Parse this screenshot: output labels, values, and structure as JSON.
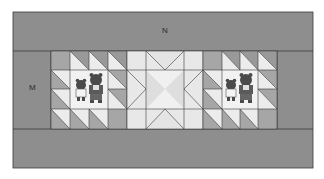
{
  "diagram": {
    "type": "quilt-layout",
    "labels": {
      "top_border": "N",
      "side_border": "M"
    },
    "colors": {
      "border": "#8e8e8e",
      "line": "#3a3a3a",
      "dark": "#999999",
      "mid": "#b9b9b9",
      "light": "#dcdcdc",
      "lighter": "#ececec",
      "center": "#f0f0f0"
    },
    "blocks": [
      {
        "name": "left-bear-block",
        "motif": "two bears"
      },
      {
        "name": "center-star-block",
        "motif": "star"
      },
      {
        "name": "right-bear-block",
        "motif": "two bears"
      }
    ]
  }
}
